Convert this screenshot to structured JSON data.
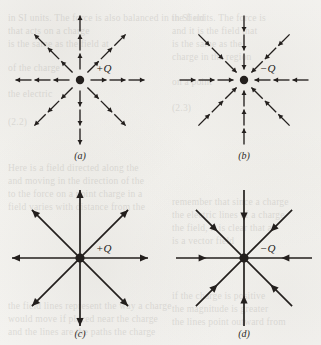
{
  "figure": {
    "kind": "electric-field-line-diagrams",
    "background_color": "#f6f5f2",
    "ink_color": "#231f1d",
    "panels": [
      {
        "id": "a",
        "caption": "(a)",
        "charge_label": "+Q",
        "charge_sign": "positive",
        "arrow_direction": "outward",
        "style": "segmented",
        "rays": 8,
        "arrows_per_ray": 3,
        "center_x": 80,
        "center_y": 80,
        "ray_length": 66,
        "caption_x": 80,
        "caption_y": 150,
        "label_dx": 16,
        "label_dy": -18
      },
      {
        "id": "b",
        "caption": "(b)",
        "charge_label": "−Q",
        "charge_sign": "negative",
        "arrow_direction": "inward",
        "style": "segmented",
        "rays": 8,
        "arrows_per_ray": 3,
        "center_x": 244,
        "center_y": 80,
        "ray_length": 66,
        "caption_x": 244,
        "caption_y": 150,
        "label_dx": 16,
        "label_dy": -18
      },
      {
        "id": "c",
        "caption": "(c)",
        "charge_label": "+Q",
        "charge_sign": "positive",
        "arrow_direction": "outward",
        "style": "continuous",
        "rays": 8,
        "arrows_per_ray": 1,
        "center_x": 80,
        "center_y": 258,
        "ray_length": 68,
        "caption_x": 80,
        "caption_y": 328,
        "label_dx": 16,
        "label_dy": -16
      },
      {
        "id": "d",
        "caption": "(d)",
        "charge_label": "−Q",
        "charge_sign": "negative",
        "arrow_direction": "inward",
        "style": "continuous",
        "rays": 8,
        "arrows_per_ray": 1,
        "center_x": 244,
        "center_y": 258,
        "ray_length": 68,
        "caption_x": 244,
        "caption_y": 328,
        "label_dx": 16,
        "label_dy": -16
      }
    ]
  },
  "ghost_text": [
    {
      "x": 8,
      "y": 12,
      "text": "in SI units. The force is also balanced in the field"
    },
    {
      "x": 8,
      "y": 25,
      "text": "that acts on a charge"
    },
    {
      "x": 8,
      "y": 38,
      "text": "is the same as the field at"
    },
    {
      "x": 8,
      "y": 62,
      "text": "of the charge"
    },
    {
      "x": 8,
      "y": 88,
      "text": "the electric"
    },
    {
      "x": 8,
      "y": 116,
      "text": "(2.2)"
    },
    {
      "x": 8,
      "y": 162,
      "text": "Here is a field directed along the"
    },
    {
      "x": 8,
      "y": 175,
      "text": "and moving in the direction of the"
    },
    {
      "x": 8,
      "y": 188,
      "text": "to the force on a point charge in a"
    },
    {
      "x": 8,
      "y": 201,
      "text": "field varies with distance from the"
    },
    {
      "x": 8,
      "y": 300,
      "text": "the field lines represent the way a charge"
    },
    {
      "x": 8,
      "y": 313,
      "text": "would move if placed near the charge"
    },
    {
      "x": 8,
      "y": 326,
      "text": "and the lines are the paths the charge"
    },
    {
      "x": 172,
      "y": 12,
      "text": "in SI units. The force is"
    },
    {
      "x": 172,
      "y": 25,
      "text": "and it is the field that"
    },
    {
      "x": 172,
      "y": 38,
      "text": "is the same as the"
    },
    {
      "x": 172,
      "y": 51,
      "text": "charge in the region"
    },
    {
      "x": 172,
      "y": 76,
      "text": "on a point"
    },
    {
      "x": 172,
      "y": 102,
      "text": "(2.3)"
    },
    {
      "x": 172,
      "y": 196,
      "text": "remember that since a charge"
    },
    {
      "x": 172,
      "y": 209,
      "text": "the electric lines of a charge"
    },
    {
      "x": 172,
      "y": 222,
      "text": "the field, it is clear that a"
    },
    {
      "x": 172,
      "y": 235,
      "text": "is a vector field"
    },
    {
      "x": 172,
      "y": 290,
      "text": "if the charge is positive"
    },
    {
      "x": 172,
      "y": 303,
      "text": "the magnitude is greater"
    },
    {
      "x": 172,
      "y": 316,
      "text": "the lines point outward from"
    }
  ]
}
